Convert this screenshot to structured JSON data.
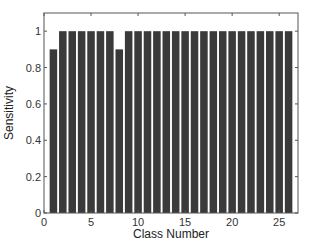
{
  "chart_data": {
    "type": "bar",
    "title": "",
    "xlabel": "Class Number",
    "ylabel": "Sensitivity",
    "categories": [
      1,
      2,
      3,
      4,
      5,
      6,
      7,
      8,
      9,
      10,
      11,
      12,
      13,
      14,
      15,
      16,
      17,
      18,
      19,
      20,
      21,
      22,
      23,
      24,
      25,
      26
    ],
    "values": [
      0.9,
      1,
      1,
      1,
      1,
      1,
      1,
      0.9,
      1,
      1,
      1,
      1,
      1,
      1,
      1,
      1,
      1,
      1,
      1,
      1,
      1,
      1,
      1,
      1,
      1,
      1
    ],
    "xlim": [
      0,
      27
    ],
    "ylim": [
      0,
      1.1
    ],
    "xticks": [
      0,
      5,
      10,
      15,
      20,
      25
    ],
    "yticks": [
      0,
      0.2,
      0.4,
      0.6,
      0.8,
      1
    ],
    "ytick_labels": [
      "0",
      "0.2",
      "0.4",
      "0.6",
      "0.8",
      "1"
    ],
    "grid": false,
    "bar_color": "#3a3a3a"
  }
}
